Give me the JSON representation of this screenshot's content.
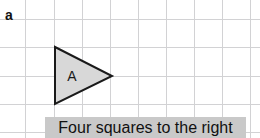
{
  "figure": {
    "panel_letter": "a",
    "caption": "Four squares to the right",
    "background_color": "#ffffff"
  },
  "grid": {
    "line_color": "#d2d2d4",
    "cell_size_px": 28,
    "vertical_line_x": [
      25,
      54,
      82,
      110,
      138,
      166,
      194,
      222,
      250
    ],
    "horizontal_line_y": [
      19,
      47,
      76,
      104,
      132
    ]
  },
  "shape": {
    "name": "triangle-a",
    "label": "A",
    "fill_color": "#d8d8d8",
    "stroke_color": "#1a1a1a",
    "points": "55,47 55,104 112,76",
    "orientation": "pointing-right"
  },
  "caption_band": {
    "background_color": "#c9c9c9",
    "text_color": "#111111"
  }
}
